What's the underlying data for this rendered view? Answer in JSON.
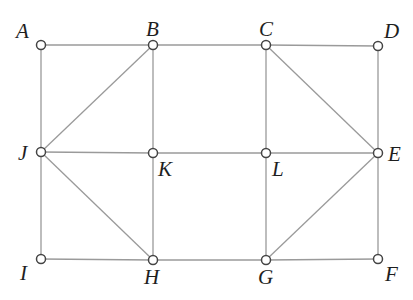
{
  "diagram": {
    "type": "graph",
    "title": "",
    "nodes": [
      {
        "id": "A",
        "label": "A",
        "x": 41,
        "y": 45,
        "label_x": 16,
        "label_y": 38
      },
      {
        "id": "B",
        "label": "B",
        "x": 153,
        "y": 45,
        "label_x": 146,
        "label_y": 36
      },
      {
        "id": "C",
        "label": "C",
        "x": 266,
        "y": 45,
        "label_x": 259,
        "label_y": 36
      },
      {
        "id": "D",
        "label": "D",
        "x": 378,
        "y": 46,
        "label_x": 384,
        "label_y": 38
      },
      {
        "id": "E",
        "label": "E",
        "x": 378,
        "y": 153,
        "label_x": 388,
        "label_y": 161
      },
      {
        "id": "F",
        "label": "F",
        "x": 378,
        "y": 259,
        "label_x": 385,
        "label_y": 281
      },
      {
        "id": "G",
        "label": "G",
        "x": 266,
        "y": 260,
        "label_x": 258,
        "label_y": 284
      },
      {
        "id": "H",
        "label": "H",
        "x": 153,
        "y": 260,
        "label_x": 144,
        "label_y": 284
      },
      {
        "id": "I",
        "label": "I",
        "x": 41,
        "y": 259,
        "label_x": 20,
        "label_y": 280
      },
      {
        "id": "J",
        "label": "J",
        "x": 41,
        "y": 152,
        "label_x": 18,
        "label_y": 160
      },
      {
        "id": "K",
        "label": "K",
        "x": 153,
        "y": 153,
        "label_x": 158,
        "label_y": 176
      },
      {
        "id": "L",
        "label": "L",
        "x": 266,
        "y": 153,
        "label_x": 272,
        "label_y": 176
      }
    ],
    "edges": [
      [
        "A",
        "B"
      ],
      [
        "B",
        "C"
      ],
      [
        "C",
        "D"
      ],
      [
        "J",
        "K"
      ],
      [
        "K",
        "L"
      ],
      [
        "L",
        "E"
      ],
      [
        "I",
        "H"
      ],
      [
        "H",
        "G"
      ],
      [
        "G",
        "F"
      ],
      [
        "A",
        "J"
      ],
      [
        "J",
        "I"
      ],
      [
        "B",
        "K"
      ],
      [
        "K",
        "H"
      ],
      [
        "C",
        "L"
      ],
      [
        "L",
        "G"
      ],
      [
        "D",
        "E"
      ],
      [
        "E",
        "F"
      ],
      [
        "B",
        "J"
      ],
      [
        "J",
        "H"
      ],
      [
        "C",
        "E"
      ],
      [
        "E",
        "G"
      ]
    ],
    "colors": {
      "edge": "#9a9a9a",
      "node_stroke": "#444444",
      "node_fill": "#ffffff",
      "label": "#1e1e1e"
    },
    "node_radius": 4.5
  }
}
